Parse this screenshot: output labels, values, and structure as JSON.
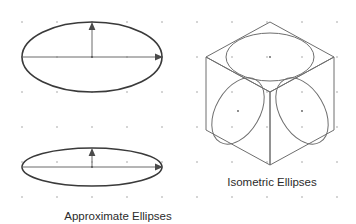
{
  "figure": {
    "title": "",
    "background_color": "#ffffff",
    "width": 356,
    "height": 224
  },
  "grid": {
    "dot_color": "#8c8c8c",
    "spacing_x": 35,
    "spacing_y": 35,
    "origin_x": 22,
    "origin_y": 22,
    "columns": 10,
    "rows": 6,
    "dot_radius": 0.7
  },
  "captions": {
    "left": {
      "text": "Approximate Ellipses",
      "x": 118,
      "y": 220,
      "color": "#2b2b2b"
    },
    "right": {
      "text": "Isometric Ellipses",
      "x": 272,
      "y": 186,
      "color": "#2b2b2b"
    }
  },
  "approximate_ellipses": {
    "stroke_color": "#3a3a3a",
    "axis_color": "#6b6b6b",
    "items": [
      {
        "name": "wide-ellipse",
        "cx": 92,
        "cy": 57,
        "rx": 70,
        "ry": 35,
        "minor_axis_label": "",
        "major_axis_label": ""
      },
      {
        "name": "flat-ellipse",
        "cx": 92,
        "cy": 167,
        "rx": 70,
        "ry": 19,
        "minor_axis_label": "",
        "major_axis_label": ""
      }
    ]
  },
  "isometric_cube": {
    "stroke_color": "#6e6e6e",
    "vertices": {
      "top": [
        270,
        22
      ],
      "left": [
        206,
        57
      ],
      "right": [
        334,
        57
      ],
      "center": [
        270,
        92
      ],
      "bottom_left": [
        206,
        130
      ],
      "bottom_right": [
        334,
        130
      ],
      "bottom": [
        270,
        165
      ]
    },
    "faces": [
      {
        "name": "top-face",
        "ellipse_center": [
          270,
          57
        ],
        "ellipse_rx": 44,
        "ellipse_ry": 24,
        "rotation": 0
      },
      {
        "name": "left-face",
        "ellipse_center": [
          238,
          111
        ],
        "ellipse_rx": 22,
        "ellipse_ry": 36,
        "rotation": 30
      },
      {
        "name": "right-face",
        "ellipse_center": [
          302,
          111
        ],
        "ellipse_rx": 22,
        "ellipse_ry": 36,
        "rotation": -30
      }
    ]
  }
}
